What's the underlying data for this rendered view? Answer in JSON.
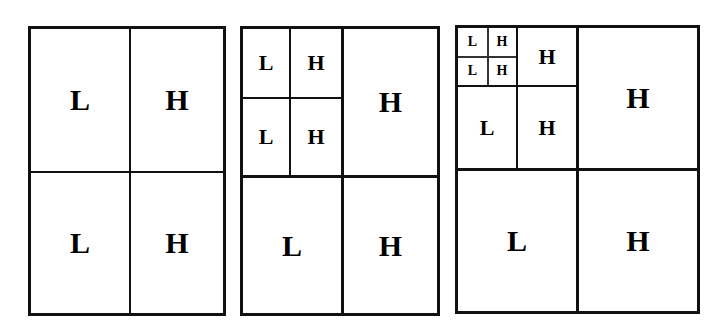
{
  "figure": {
    "background_color": "#ffffff",
    "line_color": "#111111",
    "label_color": "#000000",
    "low_label": "L",
    "high_label": "H"
  },
  "panels": [
    {
      "id": "panel-1",
      "name": "one-level-decomposition",
      "levels": 1,
      "cells": [
        {
          "label": "L",
          "role": "low",
          "quadrant": "top-left",
          "level": 1
        },
        {
          "label": "H",
          "role": "high",
          "quadrant": "top-right",
          "level": 1
        },
        {
          "label": "L",
          "role": "low",
          "quadrant": "bottom-left",
          "level": 1
        },
        {
          "label": "H",
          "role": "high",
          "quadrant": "bottom-right",
          "level": 1
        }
      ]
    },
    {
      "id": "panel-2",
      "name": "two-level-decomposition",
      "levels": 2,
      "cells": [
        {
          "label": "L",
          "role": "low",
          "quadrant": "top-left",
          "level": 2
        },
        {
          "label": "H",
          "role": "high",
          "quadrant": "top-right",
          "level": 2
        },
        {
          "label": "L",
          "role": "low",
          "quadrant": "bottom-left",
          "level": 2
        },
        {
          "label": "H",
          "role": "high",
          "quadrant": "bottom-right",
          "level": 2
        },
        {
          "label": "H",
          "role": "high",
          "quadrant": "top-right",
          "level": 1
        },
        {
          "label": "L",
          "role": "low",
          "quadrant": "bottom-left",
          "level": 1
        },
        {
          "label": "H",
          "role": "high",
          "quadrant": "bottom-right",
          "level": 1
        }
      ]
    },
    {
      "id": "panel-3",
      "name": "three-level-decomposition",
      "levels": 3,
      "cells": [
        {
          "label": "L",
          "role": "low",
          "quadrant": "top-left",
          "level": 3
        },
        {
          "label": "H",
          "role": "high",
          "quadrant": "top-right",
          "level": 3
        },
        {
          "label": "L",
          "role": "low",
          "quadrant": "bottom-left",
          "level": 3
        },
        {
          "label": "H",
          "role": "high",
          "quadrant": "bottom-right",
          "level": 3
        },
        {
          "label": "H",
          "role": "high",
          "quadrant": "top-right",
          "level": 2
        },
        {
          "label": "L",
          "role": "low",
          "quadrant": "bottom-left",
          "level": 2
        },
        {
          "label": "H",
          "role": "high",
          "quadrant": "bottom-right",
          "level": 2
        },
        {
          "label": "H",
          "role": "high",
          "quadrant": "top-right",
          "level": 1
        },
        {
          "label": "L",
          "role": "low",
          "quadrant": "bottom-left",
          "level": 1
        },
        {
          "label": "H",
          "role": "high",
          "quadrant": "bottom-right",
          "level": 1
        }
      ]
    }
  ],
  "p1": {
    "tl": "L",
    "tr": "H",
    "bl": "L",
    "br": "H"
  },
  "p2": {
    "l2_tl": "L",
    "l2_tr": "H",
    "l2_bl": "L",
    "l2_br": "H",
    "l1_tr": "H",
    "l1_bl": "L",
    "l1_br": "H"
  },
  "p3": {
    "l3_tl": "L",
    "l3_tr": "H",
    "l3_bl": "L",
    "l3_br": "H",
    "l2_tr": "H",
    "l2_bl": "L",
    "l2_br": "H",
    "l1_tr": "H",
    "l1_bl": "L",
    "l1_br": "H"
  }
}
